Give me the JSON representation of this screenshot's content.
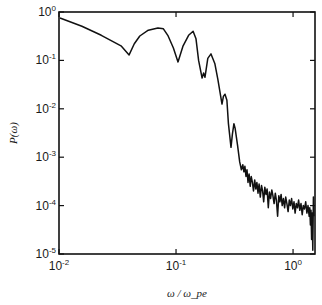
{
  "chart_data": {
    "type": "line",
    "title": "",
    "xlabel": "ω / ω_pe",
    "ylabel": "P(ω)",
    "xscale": "log",
    "yscale": "log",
    "xlim": [
      0.01,
      1.54
    ],
    "ylim": [
      1e-05,
      1
    ],
    "grid": false,
    "legend": null,
    "x_ticks": [
      {
        "value": 0.01,
        "base": "10",
        "exp": "-2"
      },
      {
        "value": 0.1,
        "base": "10",
        "exp": "-1"
      },
      {
        "value": 1,
        "base": "10",
        "exp": "0"
      }
    ],
    "y_ticks": [
      {
        "value": 1,
        "base": "10",
        "exp": "0"
      },
      {
        "value": 0.1,
        "base": "10",
        "exp": "-1"
      },
      {
        "value": 0.01,
        "base": "10",
        "exp": "-2"
      },
      {
        "value": 0.001,
        "base": "10",
        "exp": "-3"
      },
      {
        "value": 0.0001,
        "base": "10",
        "exp": "-4"
      },
      {
        "value": 1e-05,
        "base": "10",
        "exp": "-5"
      }
    ],
    "series": [
      {
        "name": "P(ω)",
        "color": "#111111",
        "x": [
          0.0102,
          0.0157,
          0.023,
          0.0339,
          0.0397,
          0.044,
          0.049,
          0.058,
          0.07,
          0.078,
          0.085,
          0.095,
          0.104,
          0.115,
          0.128,
          0.14,
          0.148,
          0.156,
          0.167,
          0.172,
          0.177,
          0.187,
          0.199,
          0.215,
          0.228,
          0.247,
          0.254,
          0.262,
          0.272,
          0.28,
          0.295,
          0.303,
          0.312,
          0.32,
          0.335,
          0.35,
          0.362,
          0.372,
          0.38,
          0.388,
          0.396,
          0.404,
          0.412,
          0.421,
          0.43,
          0.439,
          0.449,
          0.459,
          0.47,
          0.48,
          0.491,
          0.502,
          0.513,
          0.525,
          0.537,
          0.549,
          0.561,
          0.574,
          0.587,
          0.6,
          0.614,
          0.628,
          0.643,
          0.658,
          0.673,
          0.689,
          0.705,
          0.721,
          0.738,
          0.755,
          0.772,
          0.79,
          0.808,
          0.827,
          0.846,
          0.866,
          0.886,
          0.907,
          0.928,
          0.95,
          0.972,
          0.995,
          1.018,
          1.042,
          1.066,
          1.091,
          1.116,
          1.142,
          1.169,
          1.196,
          1.224,
          1.253,
          1.282,
          1.312,
          1.343,
          1.374,
          1.39,
          1.406,
          1.423,
          1.44,
          1.457,
          1.475,
          1.492,
          1.51
        ],
        "y": [
          0.75,
          0.51,
          0.33,
          0.2,
          0.13,
          0.22,
          0.32,
          0.42,
          0.47,
          0.45,
          0.33,
          0.18,
          0.093,
          0.2,
          0.33,
          0.4,
          0.28,
          0.1,
          0.043,
          0.055,
          0.045,
          0.11,
          0.136,
          0.085,
          0.04,
          0.0125,
          0.018,
          0.02,
          0.015,
          0.005,
          0.0016,
          0.003,
          0.0049,
          0.004,
          0.0018,
          0.0008,
          0.00055,
          0.0007,
          0.0005,
          0.00065,
          0.0004,
          0.00055,
          0.0003,
          0.00045,
          0.00025,
          0.0004,
          0.0003,
          0.0002,
          0.00034,
          0.00022,
          0.0003,
          0.00018,
          0.00028,
          0.00015,
          0.00026,
          0.0002,
          0.00012,
          0.00024,
          0.00017,
          0.00022,
          9e-05,
          0.00019,
          0.00014,
          0.00021,
          0.00016,
          0.00011,
          0.00018,
          0.00013,
          6e-05,
          0.00016,
          0.00012,
          0.00017,
          0.0001,
          0.00014,
          9e-05,
          0.00015,
          0.00011,
          7.5e-05,
          0.00013,
          0.0001,
          0.00014,
          8.5e-05,
          0.00012,
          7e-05,
          0.00011,
          9e-05,
          0.00013,
          8e-05,
          0.00011,
          6.5e-05,
          0.0001,
          8.5e-05,
          0.00012,
          7e-05,
          0.0001,
          6e-05,
          9e-05,
          4e-05,
          8e-05,
          2e-05,
          7e-05,
          1.2e-05,
          0.00015,
          6e-05
        ]
      }
    ]
  }
}
